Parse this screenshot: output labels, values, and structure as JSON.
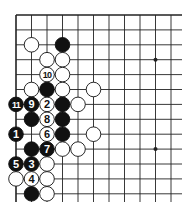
{
  "diagram": {
    "type": "go-board-corner",
    "grid": {
      "origin_x": 16,
      "origin_y": 15,
      "dx": 15.5,
      "dy": 14.9,
      "cols": 11,
      "rows": 13,
      "right_extent": 182,
      "bottom_extent": 202,
      "line_color": "#222222",
      "edge_width": 1.6,
      "line_width": 0.9
    },
    "star_points": [
      {
        "col": 9,
        "row": 3
      },
      {
        "col": 9,
        "row": 9
      }
    ],
    "stones": [
      {
        "col": 1,
        "row": 2,
        "color": "white",
        "label": ""
      },
      {
        "col": 3,
        "row": 2,
        "color": "black",
        "label": ""
      },
      {
        "col": 2,
        "row": 3,
        "color": "white",
        "label": ""
      },
      {
        "col": 3,
        "row": 3,
        "color": "white",
        "label": ""
      },
      {
        "col": 2,
        "row": 4,
        "color": "white",
        "label": "10"
      },
      {
        "col": 3,
        "row": 4,
        "color": "white",
        "label": ""
      },
      {
        "col": 1,
        "row": 5,
        "color": "white",
        "label": ""
      },
      {
        "col": 2,
        "row": 5,
        "color": "black",
        "label": ""
      },
      {
        "col": 3,
        "row": 5,
        "color": "white",
        "label": ""
      },
      {
        "col": 5,
        "row": 5,
        "color": "white",
        "label": ""
      },
      {
        "col": 0,
        "row": 6,
        "color": "black",
        "label": "11"
      },
      {
        "col": 1,
        "row": 6,
        "color": "black",
        "label": "9"
      },
      {
        "col": 2,
        "row": 6,
        "color": "white",
        "label": "2"
      },
      {
        "col": 3,
        "row": 6,
        "color": "black",
        "label": ""
      },
      {
        "col": 4,
        "row": 6,
        "color": "white",
        "label": ""
      },
      {
        "col": 1,
        "row": 7,
        "color": "black",
        "label": ""
      },
      {
        "col": 2,
        "row": 7,
        "color": "white",
        "label": "8"
      },
      {
        "col": 3,
        "row": 7,
        "color": "black",
        "label": ""
      },
      {
        "col": 0,
        "row": 8,
        "color": "black",
        "label": "1"
      },
      {
        "col": 2,
        "row": 8,
        "color": "white",
        "label": "6"
      },
      {
        "col": 3,
        "row": 8,
        "color": "black",
        "label": ""
      },
      {
        "col": 5,
        "row": 8,
        "color": "white",
        "label": ""
      },
      {
        "col": 1,
        "row": 9,
        "color": "black",
        "label": ""
      },
      {
        "col": 2,
        "row": 9,
        "color": "black",
        "label": "7"
      },
      {
        "col": 3,
        "row": 9,
        "color": "white",
        "label": ""
      },
      {
        "col": 4,
        "row": 9,
        "color": "white",
        "label": ""
      },
      {
        "col": 0,
        "row": 10,
        "color": "black",
        "label": "5"
      },
      {
        "col": 1,
        "row": 10,
        "color": "black",
        "label": "3"
      },
      {
        "col": 2,
        "row": 10,
        "color": "white",
        "label": ""
      },
      {
        "col": 0,
        "row": 11,
        "color": "white",
        "label": ""
      },
      {
        "col": 1,
        "row": 11,
        "color": "white",
        "label": "4"
      },
      {
        "col": 2,
        "row": 11,
        "color": "white",
        "label": ""
      },
      {
        "col": 1,
        "row": 12,
        "color": "black",
        "label": ""
      },
      {
        "col": 2,
        "row": 12,
        "color": "white",
        "label": ""
      }
    ],
    "colors": {
      "black_stone": "#111111",
      "white_stone": "#ffffff",
      "stone_outline": "#111111",
      "black_label": "#ffffff",
      "white_label": "#111111"
    }
  }
}
